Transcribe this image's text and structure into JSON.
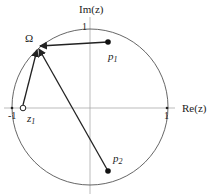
{
  "diagram": {
    "axes": {
      "x_label": "Re(z)",
      "y_label": "Im(z)",
      "ticks": {
        "neg_one": "-1",
        "pos_one_x": "1",
        "pos_one_y": "1"
      }
    },
    "points": {
      "omega": {
        "label": "Ω",
        "kind": "point-on-circle"
      },
      "p1": {
        "label_base": "p",
        "label_sub": "1",
        "kind": "pole"
      },
      "p2": {
        "label_base": "p",
        "label_sub": "2",
        "kind": "pole"
      },
      "z1": {
        "label_base": "z",
        "label_sub": "1",
        "kind": "zero"
      }
    },
    "arrows": [
      {
        "from": "p1",
        "to": "omega"
      },
      {
        "from": "p2",
        "to": "omega"
      },
      {
        "from": "z1",
        "to": "omega"
      }
    ],
    "colors": {
      "stroke": "#222222",
      "axis": "#999999",
      "circle": "#555555"
    }
  }
}
